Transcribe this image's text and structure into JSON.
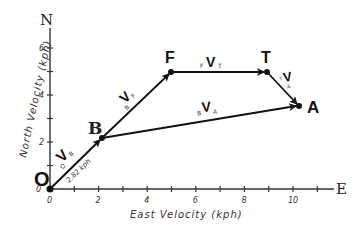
{
  "diagram": {
    "type": "vector-diagram",
    "axes": {
      "x_label": "East Velocity (kph)",
      "y_label": "North Velocity (kph)",
      "x_end_label": "E",
      "y_end_label": "N",
      "x_ticks": [
        "0",
        "2",
        "4",
        "6",
        "8",
        "10"
      ],
      "y_ticks": [
        "0",
        "2",
        "4",
        "6"
      ],
      "x_range": [
        0,
        11.5
      ],
      "y_range": [
        0,
        7
      ]
    },
    "points": [
      {
        "label": "O",
        "x": 0,
        "y": 0
      },
      {
        "label": "B",
        "x": 2.1,
        "y": 2.2
      },
      {
        "label": "F",
        "x": 5.0,
        "y": 5.0
      },
      {
        "label": "T",
        "x": 8.9,
        "y": 5.0
      },
      {
        "label": "A",
        "x": 10.2,
        "y": 3.5
      }
    ],
    "vectors": [
      {
        "from": "O",
        "to": "B",
        "label": "V",
        "pre_sub": "O",
        "post_sub": "B",
        "annotation": "2.82 kph"
      },
      {
        "from": "B",
        "to": "F",
        "label": "V",
        "pre_sub": "B",
        "post_sub": "F"
      },
      {
        "from": "F",
        "to": "T",
        "label": "V",
        "pre_sub": "F",
        "post_sub": "T"
      },
      {
        "from": "T",
        "to": "A",
        "label": "V",
        "pre_sub": "T",
        "post_sub": "A"
      },
      {
        "from": "B",
        "to": "A",
        "label": "V",
        "pre_sub": "B",
        "post_sub": "A"
      }
    ]
  }
}
